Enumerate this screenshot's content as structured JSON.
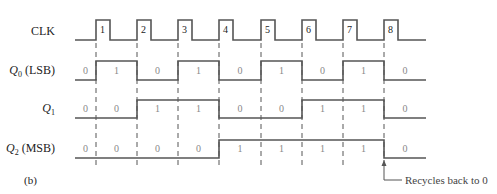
{
  "figure_label": "(b)",
  "annotation": "Recycles back to 0",
  "clock": {
    "label": "CLK",
    "pulses": [
      "1",
      "2",
      "3",
      "4",
      "5",
      "6",
      "7",
      "8"
    ]
  },
  "signals": [
    {
      "name": "Q",
      "sub": "0",
      "suffix": " (LSB)",
      "values": [
        "0",
        "1",
        "0",
        "1",
        "0",
        "1",
        "0",
        "1",
        "0"
      ]
    },
    {
      "name": "Q",
      "sub": "1",
      "suffix": "",
      "values": [
        "0",
        "0",
        "1",
        "1",
        "0",
        "0",
        "1",
        "1",
        "0"
      ]
    },
    {
      "name": "Q",
      "sub": "2",
      "suffix": " (MSB)",
      "values": [
        "0",
        "0",
        "0",
        "0",
        "1",
        "1",
        "1",
        "1",
        "0"
      ]
    }
  ]
}
